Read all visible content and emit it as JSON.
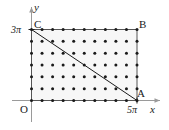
{
  "figure": {
    "background_color": "#ffffff",
    "ink_color": "#1a1a1a",
    "shade_color": "#f7f7f7"
  },
  "axes": {
    "x_label": "x",
    "y_label": "y",
    "origin_label": "O",
    "x_tick_label": "5π",
    "y_tick_label": "3π",
    "x_range": [
      0,
      5
    ],
    "y_range": [
      0,
      3
    ],
    "arrows": true
  },
  "vertices": [
    {
      "name": "O",
      "label": "O",
      "x": 0,
      "y": 0
    },
    {
      "name": "A",
      "label": "A",
      "x": 5,
      "y": 0
    },
    {
      "name": "B",
      "label": "B",
      "x": 5,
      "y": 3
    },
    {
      "name": "C",
      "label": "C",
      "x": 0,
      "y": 3
    }
  ],
  "rectangle": {
    "x0": 0,
    "y0": 0,
    "x1": 5,
    "y1": 3,
    "stroke_color": "#555555"
  },
  "diagonal": {
    "from": "C",
    "to": "A",
    "from_point": [
      0,
      3
    ],
    "to_point": [
      5,
      0
    ],
    "stroke_color": "#1a1a1a"
  },
  "lattice": {
    "columns": 11,
    "rows": 7,
    "x_step": 0.5,
    "y_step": 0.5,
    "dot_color": "#1a1a1a",
    "dot_radius": 1.5
  }
}
